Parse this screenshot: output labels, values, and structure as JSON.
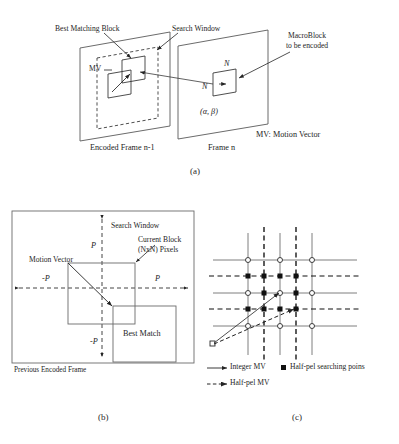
{
  "figure": {
    "panels": [
      {
        "id": "a",
        "caption": "(a)"
      },
      {
        "id": "b",
        "caption": "(b)"
      },
      {
        "id": "c",
        "caption": "(c)"
      }
    ]
  },
  "panel_a": {
    "label_best_matching_block": "Best Matching Block",
    "label_search_window": "Search Window",
    "label_macroblock_line1": "MacroBlock",
    "label_macroblock_line2": "to be encoded",
    "label_mv": "MV",
    "label_n_top": "N",
    "label_n_left": "N",
    "label_alpha_beta": "(α, β)",
    "label_frame_left": "Encoded Frame n-1",
    "label_frame_right": "Frame n",
    "label_mv_legend": "MV: Motion Vector"
  },
  "panel_b": {
    "label_search_window": "Search Window",
    "label_current_block_line1": "Current Block",
    "label_current_block_line2": "(NxN) Pixels",
    "label_motion_vector": "Motion Vector",
    "label_best_match": "Best Match",
    "label_p_top": "P",
    "label_p_right": "P",
    "label_p_left": "-P",
    "label_p_bottom": "-P",
    "label_previous_frame": "Previous Encoded Frame"
  },
  "panel_c": {
    "legend": [
      {
        "marker": "solid-arrow-icon",
        "text": "Integer MV"
      },
      {
        "marker": "filled-square-icon",
        "text": "Half-pel searching poins"
      },
      {
        "marker": "dashed-arrow-icon",
        "text": "Half-pel MV"
      }
    ],
    "grid": {
      "solid_columns_x": [
        248,
        280,
        312
      ],
      "solid_rows_y": [
        268,
        290,
        312
      ],
      "dashed_columns_x": [
        264,
        296
      ],
      "dashed_rows_y": [
        257,
        301
      ],
      "integer_point_marker": "open-circle",
      "halfpel_point_marker": "filled-square"
    }
  },
  "colors": {
    "ink": "#242424",
    "line": "#3a3a3a",
    "grid_solid": "#6b6b6b",
    "grid_dashed": "#111111",
    "background": "#ffffff"
  }
}
